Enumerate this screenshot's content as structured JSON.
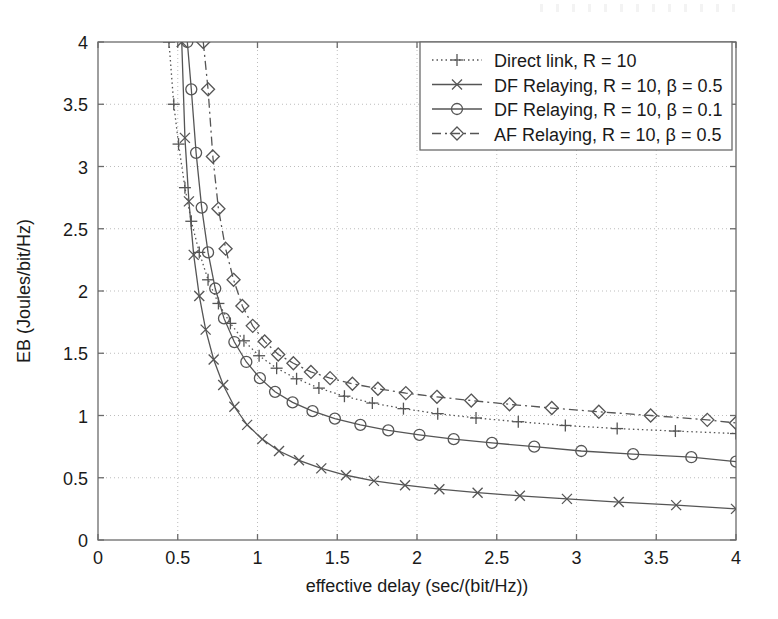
{
  "chart_data": {
    "type": "line",
    "title": "",
    "xlabel": "effective delay (sec/(bit/Hz))",
    "ylabel": "EB (Joules/bit/Hz)",
    "xlim": [
      0,
      4
    ],
    "ylim": [
      0,
      4
    ],
    "xticks": [
      "0",
      "0.5",
      "1",
      "1.5",
      "2",
      "2.5",
      "3",
      "3.5",
      "4"
    ],
    "xtick_values": [
      0,
      0.5,
      1,
      1.5,
      2,
      2.5,
      3,
      3.5,
      4
    ],
    "yticks": [
      "0",
      "0.5",
      "1",
      "1.5",
      "2",
      "2.5",
      "3",
      "3.5",
      "4"
    ],
    "ytick_values": [
      0,
      0.5,
      1,
      1.5,
      2,
      2.5,
      3,
      3.5,
      4
    ],
    "grid": true,
    "grid_style": "dotted",
    "legend_position": "top-right",
    "series": [
      {
        "name": "Direct link, R = 10",
        "marker": "plus",
        "linestyle": "dotted",
        "color": "#555555",
        "x": [
          0.445,
          0.475,
          0.505,
          0.545,
          0.585,
          0.635,
          0.69,
          0.755,
          0.83,
          0.915,
          1.01,
          1.12,
          1.245,
          1.385,
          1.545,
          1.72,
          1.915,
          2.13,
          2.37,
          2.635,
          2.93,
          3.255,
          3.62,
          4.0
        ],
        "y": [
          4.0,
          3.5,
          3.18,
          2.83,
          2.56,
          2.31,
          2.09,
          1.9,
          1.74,
          1.6,
          1.48,
          1.38,
          1.295,
          1.22,
          1.155,
          1.1,
          1.055,
          1.015,
          0.98,
          0.95,
          0.92,
          0.895,
          0.875,
          0.855
        ]
      },
      {
        "name": "DF Relaying, R = 10, β = 0.5",
        "marker": "cross",
        "linestyle": "solid",
        "color": "#555555",
        "x": [
          0.525,
          0.545,
          0.57,
          0.6,
          0.635,
          0.675,
          0.725,
          0.785,
          0.855,
          0.935,
          1.03,
          1.135,
          1.26,
          1.4,
          1.555,
          1.73,
          1.925,
          2.14,
          2.38,
          2.645,
          2.94,
          3.265,
          3.625,
          4.0
        ],
        "y": [
          4.0,
          3.23,
          2.72,
          2.29,
          1.96,
          1.69,
          1.45,
          1.245,
          1.07,
          0.925,
          0.81,
          0.715,
          0.64,
          0.575,
          0.52,
          0.475,
          0.44,
          0.408,
          0.38,
          0.355,
          0.33,
          0.305,
          0.28,
          0.25
        ]
      },
      {
        "name": "DF Relaying, R = 10, β = 0.1",
        "marker": "circle",
        "linestyle": "solid",
        "color": "#555555",
        "x": [
          0.56,
          0.585,
          0.615,
          0.65,
          0.69,
          0.735,
          0.79,
          0.855,
          0.93,
          1.015,
          1.11,
          1.22,
          1.345,
          1.485,
          1.645,
          1.82,
          2.015,
          2.23,
          2.47,
          2.735,
          3.03,
          3.355,
          3.72,
          4.0
        ],
        "y": [
          4.0,
          3.62,
          3.11,
          2.67,
          2.31,
          2.02,
          1.78,
          1.59,
          1.43,
          1.3,
          1.19,
          1.105,
          1.035,
          0.975,
          0.925,
          0.88,
          0.845,
          0.81,
          0.78,
          0.75,
          0.715,
          0.69,
          0.665,
          0.63
        ]
      },
      {
        "name": "AF Relaying, R = 10, β = 0.5",
        "marker": "diamond",
        "linestyle": "dashdot",
        "color": "#555555",
        "x": [
          0.66,
          0.69,
          0.72,
          0.755,
          0.8,
          0.85,
          0.905,
          0.97,
          1.045,
          1.13,
          1.225,
          1.335,
          1.455,
          1.595,
          1.755,
          1.93,
          2.125,
          2.34,
          2.58,
          2.845,
          3.14,
          3.465,
          3.82,
          4.0
        ],
        "y": [
          4.0,
          3.62,
          3.08,
          2.66,
          2.34,
          2.09,
          1.88,
          1.72,
          1.595,
          1.49,
          1.42,
          1.35,
          1.3,
          1.255,
          1.215,
          1.18,
          1.15,
          1.12,
          1.09,
          1.06,
          1.03,
          1.0,
          0.965,
          0.94
        ]
      }
    ]
  },
  "axes": {
    "xlabel": "effective delay (sec/(bit/Hz))",
    "ylabel": "EB (Joules/bit/Hz)"
  },
  "legend": {
    "items": [
      {
        "label": "Direct link, R = 10"
      },
      {
        "label": "DF Relaying, R = 10, β = 0.5"
      },
      {
        "label": "DF Relaying, R = 10, β = 0.1"
      },
      {
        "label": "AF Relaying, R = 10, β = 0.5"
      }
    ]
  },
  "style": {
    "axis_color": "#6b6b6b",
    "line_color": "#555555",
    "grid_color": "#bdbdbd",
    "text_color": "#1a1a1a",
    "background": "#ffffff"
  }
}
